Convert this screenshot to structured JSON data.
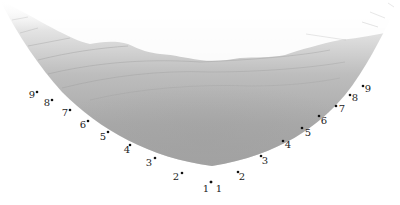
{
  "diagram": {
    "type": "3d-surface-bowl",
    "colors": {
      "background": "#ffffff",
      "surface_dark": "#9e9e9e",
      "surface_mid": "#b5b5b5",
      "surface_light": "#e2e2e2",
      "contour": "#8a8a8a",
      "tick_text": "#222222",
      "tick_dot": "#111111"
    },
    "left_axis": {
      "ticks": [
        {
          "label": "1",
          "dot": [
            211,
            182
          ],
          "text": [
            206,
            192
          ]
        },
        {
          "label": "2",
          "dot": [
            182,
            173
          ],
          "text": [
            176,
            180
          ]
        },
        {
          "label": "3",
          "dot": [
            155,
            158
          ],
          "text": [
            149,
            166
          ]
        },
        {
          "label": "4",
          "dot": [
            130,
            145
          ],
          "text": [
            127,
            153
          ]
        },
        {
          "label": "5",
          "dot": [
            108,
            132
          ],
          "text": [
            103,
            140
          ]
        },
        {
          "label": "6",
          "dot": [
            88,
            121
          ],
          "text": [
            83,
            128
          ]
        },
        {
          "label": "7",
          "dot": [
            70,
            110
          ],
          "text": [
            65,
            116
          ]
        },
        {
          "label": "8",
          "dot": [
            52,
            100
          ],
          "text": [
            47,
            106
          ]
        },
        {
          "label": "9",
          "dot": [
            37,
            92
          ],
          "text": [
            32,
            98
          ]
        }
      ]
    },
    "right_axis": {
      "ticks": [
        {
          "label": "1",
          "dot": [
            211,
            182
          ],
          "text": [
            219,
            192
          ]
        },
        {
          "label": "2",
          "dot": [
            238,
            172
          ],
          "text": [
            242,
            180
          ]
        },
        {
          "label": "3",
          "dot": [
            261,
            156
          ],
          "text": [
            265,
            164
          ]
        },
        {
          "label": "4",
          "dot": [
            283,
            141
          ],
          "text": [
            288,
            148
          ]
        },
        {
          "label": "5",
          "dot": [
            302,
            128
          ],
          "text": [
            308,
            136
          ]
        },
        {
          "label": "6",
          "dot": [
            319,
            116
          ],
          "text": [
            324,
            124
          ]
        },
        {
          "label": "7",
          "dot": [
            336,
            106
          ],
          "text": [
            342,
            112
          ]
        },
        {
          "label": "8",
          "dot": [
            350,
            95
          ],
          "text": [
            355,
            101
          ]
        },
        {
          "label": "9",
          "dot": [
            363,
            86
          ],
          "text": [
            368,
            92
          ]
        }
      ]
    }
  }
}
